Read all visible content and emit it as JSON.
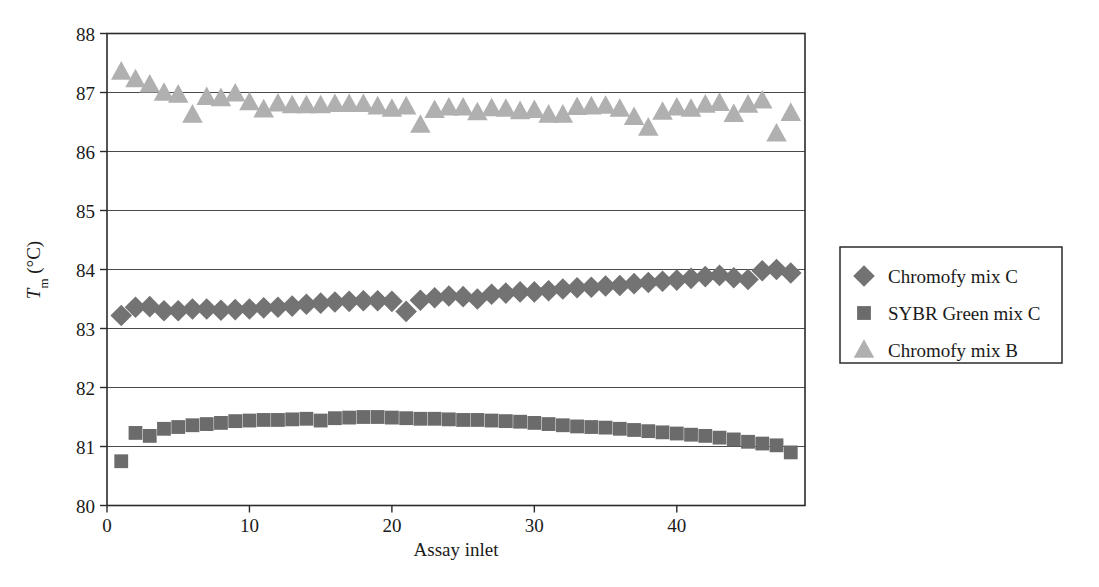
{
  "chart_data": {
    "type": "scatter",
    "title": "",
    "xlabel": "Assay inlet",
    "ylabel": "T_m (°C)",
    "ylabel_parts": {
      "main": "T",
      "sub": "m",
      "unit": " (°C)"
    },
    "xlim": [
      0,
      49
    ],
    "ylim": [
      80,
      88
    ],
    "xticks": [
      0,
      10,
      20,
      30,
      40
    ],
    "yticks": [
      80,
      81,
      82,
      83,
      84,
      85,
      86,
      87,
      88
    ],
    "grid": "horizontal",
    "legend_position": "right-outside",
    "series": [
      {
        "name": "Chromofy mix C",
        "marker": "diamond",
        "color": "#737373",
        "x": [
          1,
          2,
          3,
          4,
          5,
          6,
          7,
          8,
          9,
          10,
          11,
          12,
          13,
          14,
          15,
          16,
          17,
          18,
          19,
          20,
          21,
          22,
          23,
          24,
          25,
          26,
          27,
          28,
          29,
          30,
          31,
          32,
          33,
          34,
          35,
          36,
          37,
          38,
          39,
          40,
          41,
          42,
          43,
          44,
          45,
          46,
          47,
          48
        ],
        "values": [
          83.22,
          83.36,
          83.37,
          83.3,
          83.3,
          83.33,
          83.33,
          83.31,
          83.32,
          83.33,
          83.35,
          83.36,
          83.38,
          83.41,
          83.43,
          83.45,
          83.46,
          83.47,
          83.47,
          83.46,
          83.29,
          83.48,
          83.52,
          83.55,
          83.54,
          83.5,
          83.58,
          83.6,
          83.62,
          83.62,
          83.64,
          83.67,
          83.69,
          83.7,
          83.72,
          83.73,
          83.76,
          83.78,
          83.8,
          83.82,
          83.85,
          83.88,
          83.9,
          83.86,
          83.83,
          83.98,
          84.0,
          83.94
        ]
      },
      {
        "name": "SYBR Green mix C",
        "marker": "square",
        "color": "#6b6b6b",
        "x": [
          1,
          2,
          3,
          4,
          5,
          6,
          7,
          8,
          9,
          10,
          11,
          12,
          13,
          14,
          15,
          16,
          17,
          18,
          19,
          20,
          21,
          22,
          23,
          24,
          25,
          26,
          27,
          28,
          29,
          30,
          31,
          32,
          33,
          34,
          35,
          36,
          37,
          38,
          39,
          40,
          41,
          42,
          43,
          44,
          45,
          46,
          47,
          48
        ],
        "values": [
          80.75,
          81.23,
          81.18,
          81.3,
          81.33,
          81.36,
          81.38,
          81.4,
          81.43,
          81.44,
          81.45,
          81.45,
          81.46,
          81.47,
          81.44,
          81.48,
          81.49,
          81.5,
          81.5,
          81.49,
          81.48,
          81.47,
          81.47,
          81.46,
          81.45,
          81.45,
          81.44,
          81.43,
          81.42,
          81.4,
          81.38,
          81.36,
          81.34,
          81.33,
          81.32,
          81.3,
          81.28,
          81.26,
          81.24,
          81.22,
          81.2,
          81.18,
          81.15,
          81.12,
          81.08,
          81.05,
          81.02,
          80.9
        ]
      },
      {
        "name": "Chromofy mix B",
        "marker": "triangle",
        "color": "#b0b0b0",
        "x": [
          1,
          2,
          3,
          4,
          5,
          6,
          7,
          8,
          9,
          10,
          11,
          12,
          13,
          14,
          15,
          16,
          17,
          18,
          19,
          20,
          21,
          22,
          23,
          24,
          25,
          26,
          27,
          28,
          29,
          30,
          31,
          32,
          33,
          34,
          35,
          36,
          37,
          38,
          39,
          40,
          41,
          42,
          43,
          44,
          45,
          46,
          47,
          48
        ],
        "values": [
          87.35,
          87.22,
          87.13,
          86.99,
          86.96,
          86.62,
          86.92,
          86.9,
          86.98,
          86.83,
          86.71,
          86.81,
          86.78,
          86.78,
          86.78,
          86.8,
          86.8,
          86.8,
          86.76,
          86.72,
          86.76,
          86.45,
          86.7,
          86.74,
          86.74,
          86.66,
          86.73,
          86.72,
          86.68,
          86.7,
          86.62,
          86.62,
          86.75,
          86.76,
          86.77,
          86.72,
          86.58,
          86.4,
          86.67,
          86.74,
          86.72,
          86.79,
          86.82,
          86.63,
          86.79,
          86.86,
          86.3,
          86.65
        ]
      }
    ]
  },
  "legend": {
    "items": [
      {
        "label": "Chromofy mix C",
        "marker": "diamond",
        "color": "#737373"
      },
      {
        "label": "SYBR Green mix C",
        "marker": "square",
        "color": "#6b6b6b"
      },
      {
        "label": "Chromofy mix B",
        "marker": "triangle",
        "color": "#b0b0b0"
      }
    ]
  },
  "axes": {
    "x_title": "Assay inlet",
    "y_title_main": "T",
    "y_title_sub": "m",
    "y_title_unit": " (°C)",
    "x_tick_labels": [
      "0",
      "10",
      "20",
      "30",
      "40"
    ],
    "y_tick_labels": [
      "80",
      "81",
      "82",
      "83",
      "84",
      "85",
      "86",
      "87",
      "88"
    ]
  }
}
